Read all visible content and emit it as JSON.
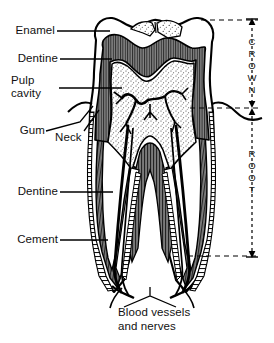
{
  "figure": {
    "type": "anatomical-diagram",
    "background_color": "#ffffff",
    "line_color": "#000000"
  },
  "labels": {
    "enamel": "Enamel",
    "dentine_crown": "Dentine",
    "pulp_line1": "Pulp",
    "pulp_line2": "cavity",
    "gum": "Gum",
    "neck": "Neck",
    "dentine_root": "Dentine",
    "cement": "Cement",
    "caption_line1": "Blood vessels",
    "caption_line2": "and nerves"
  },
  "brackets": {
    "crown": "CROWN",
    "root": "ROOT"
  },
  "regions": {
    "enamel_fill": "#ffffff",
    "dentine_fill": "#6b6b6b",
    "pulp_fill": "#ffffff",
    "vessel_fill": "#000000",
    "stipple_fill": "#ffffff"
  }
}
